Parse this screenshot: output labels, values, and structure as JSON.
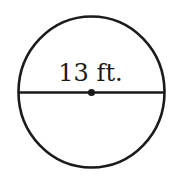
{
  "diagram": {
    "shape": "circle",
    "segment": "diameter",
    "label": "13 ft.",
    "measurement": {
      "value": 13,
      "unit": "ft."
    },
    "center_point": true,
    "colors": {
      "stroke": "#1a1a1a",
      "background": "#ffffff"
    }
  }
}
